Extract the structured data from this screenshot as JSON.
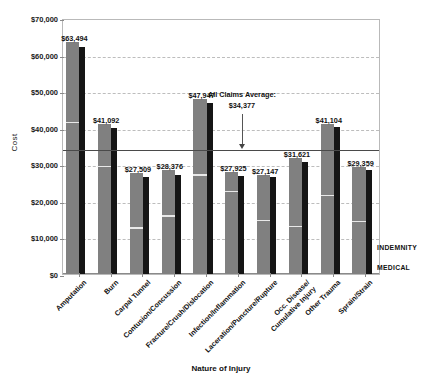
{
  "chart_data": {
    "type": "bar",
    "title": "",
    "xlabel": "Nature of Injury",
    "ylabel": "Cost",
    "ylim": [
      0,
      70000
    ],
    "ytick_values": [
      0,
      10000,
      20000,
      30000,
      40000,
      50000,
      60000,
      70000
    ],
    "ytick_labels": [
      "$0",
      "$10,000",
      "$20,000",
      "$30,000",
      "$40,000",
      "$50,000",
      "$60,000",
      "$70,000"
    ],
    "grid": true,
    "legend_position": "right",
    "categories": [
      "Amputation",
      "Burn",
      "Carpal Tunnel",
      "Contusion/Concussion",
      "Fracture/Crush/Dislocation",
      "Infection/Inflammation",
      "Laceration/Puncture/Rupture",
      "Occ. Disease/\nCumulative Injury",
      "Other Trauma",
      "Sprain/Strain"
    ],
    "series": [
      {
        "name": "INDEMNITY",
        "color": "#808080",
        "values": [
          63494,
          41092,
          27509,
          28376,
          47947,
          27925,
          27147,
          31621,
          41104,
          29359
        ],
        "split_values": [
          41200,
          29300,
          12400,
          15700,
          26900,
          22500,
          14400,
          12900,
          21400,
          14200
        ]
      },
      {
        "name": "MEDICAL",
        "color": "#151515",
        "values": [
          62000,
          39800,
          26500,
          27200,
          46700,
          26900,
          26400,
          30700,
          40300,
          28500
        ]
      }
    ],
    "data_labels": [
      "$63,494",
      "$41,092",
      "$27,509",
      "$28,376",
      "$47,947",
      "$27,925",
      "$27,147",
      "$31,621",
      "$41,104",
      "$29,359"
    ],
    "annotation": {
      "line1": "All Claims Average:",
      "line2": "$34,377",
      "value": 34377
    }
  }
}
